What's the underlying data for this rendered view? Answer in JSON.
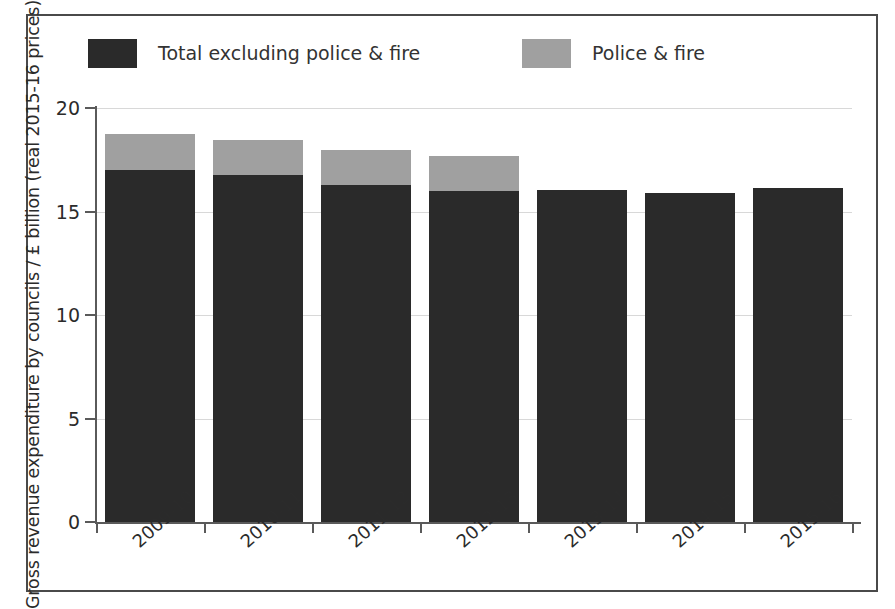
{
  "chart_data": {
    "type": "bar",
    "stacked": true,
    "title": "",
    "xlabel": "",
    "ylabel": "Gross revenue expenditure by councils / £ billion (real 2015-16 prices)",
    "categories": [
      "2009-10",
      "2010-11",
      "2011-12",
      "2012-13",
      "2013-14",
      "2014-15",
      "2015-16"
    ],
    "series": [
      {
        "name": "Total excluding police & fire",
        "color": "#2a2a2a",
        "values": [
          17.0,
          16.75,
          16.3,
          16.0,
          16.05,
          15.9,
          16.15
        ]
      },
      {
        "name": "Police & fire",
        "color": "#a0a0a0",
        "values": [
          1.75,
          1.7,
          1.65,
          1.7,
          0,
          0,
          0
        ]
      }
    ],
    "totals": [
      18.75,
      18.45,
      17.95,
      17.7,
      16.05,
      15.9,
      16.15
    ],
    "ylim": [
      0,
      20
    ],
    "yticks": [
      "0",
      "5",
      "10",
      "15",
      "20"
    ],
    "ytick_values": [
      0,
      5,
      10,
      15,
      20
    ],
    "grid": true,
    "legend_position": "top"
  },
  "legend": {
    "entries": [
      {
        "label": "Total excluding police & fire",
        "color": "#2a2a2a"
      },
      {
        "label": "Police & fire",
        "color": "#a0a0a0"
      }
    ]
  },
  "axes": {
    "y_title": "Gross revenue expenditure by councils / £ billion (real 2015-16 prices)"
  }
}
